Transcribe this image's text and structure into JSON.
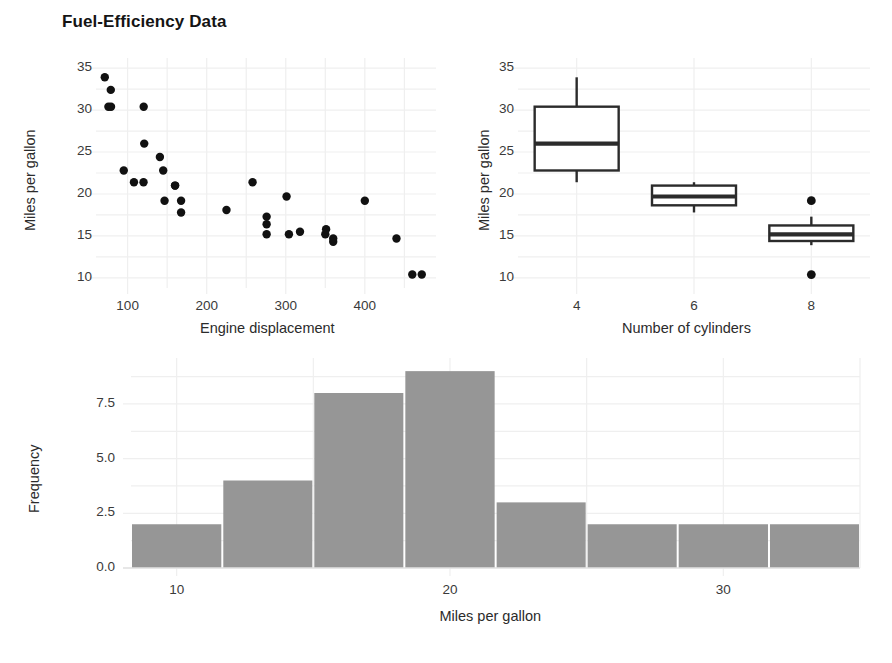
{
  "figure": {
    "title": "Fuel-Efficiency Data",
    "background_color": "#ffffff",
    "grid_color": "#efefef",
    "point_color": "#111111",
    "bar_color": "#969696",
    "box_line_color": "#2b2b2b"
  },
  "chart_data": [
    {
      "type": "scatter",
      "id": "mpg-vs-displacement",
      "title": "",
      "xlabel": "Engine displacement",
      "ylabel": "Miles per gallon",
      "xlim": [
        60,
        490
      ],
      "ylim": [
        8.8,
        36.2
      ],
      "xticks": [
        100,
        200,
        300,
        400
      ],
      "yticks": [
        10,
        15,
        20,
        25,
        30,
        35
      ],
      "grid": true,
      "legend": "none",
      "x": [
        71.1,
        75.7,
        78.7,
        79.0,
        95.1,
        108.0,
        120.1,
        120.3,
        121.0,
        140.8,
        145.0,
        146.7,
        160.0,
        160.0,
        167.6,
        167.6,
        225.0,
        258.0,
        275.8,
        275.8,
        275.8,
        301.0,
        304.0,
        318.0,
        350.0,
        351.0,
        360.0,
        360.0,
        400.0,
        440.0,
        460.0,
        472.0
      ],
      "y": [
        33.9,
        30.4,
        32.4,
        30.4,
        22.8,
        21.4,
        21.4,
        30.4,
        26.0,
        24.4,
        22.8,
        19.2,
        21.0,
        21.0,
        17.8,
        19.2,
        18.1,
        21.4,
        16.4,
        17.3,
        15.2,
        19.7,
        15.2,
        15.5,
        15.2,
        15.8,
        14.3,
        14.7,
        19.2,
        14.7,
        10.4,
        10.4
      ]
    },
    {
      "type": "boxplot",
      "id": "mpg-by-cylinders",
      "title": "",
      "xlabel": "Number of cylinders",
      "ylabel": "Miles per gallon",
      "ylim": [
        8.8,
        36.2
      ],
      "yticks": [
        10,
        15,
        20,
        25,
        30,
        35
      ],
      "xticks": [
        "4",
        "6",
        "8"
      ],
      "grid": true,
      "legend": "none",
      "boxes": [
        {
          "category": "4",
          "min": 21.4,
          "q1": 22.8,
          "median": 26.0,
          "q3": 30.4,
          "max": 33.9,
          "outliers": []
        },
        {
          "category": "6",
          "min": 17.8,
          "q1": 18.65,
          "median": 19.7,
          "q3": 21.0,
          "max": 21.4,
          "outliers": []
        },
        {
          "category": "8",
          "min": 13.9,
          "q1": 14.4,
          "median": 15.2,
          "q3": 16.25,
          "max": 17.3,
          "outliers": [
            19.2,
            10.4
          ]
        }
      ]
    },
    {
      "type": "bar",
      "id": "mpg-histogram",
      "title": "",
      "xlabel": "Miles per gallon",
      "ylabel": "Frequency",
      "xlim": [
        8.33,
        35.0
      ],
      "ylim": [
        0,
        9.6
      ],
      "xticks": [
        10,
        20,
        30
      ],
      "yticks": [
        0.0,
        2.5,
        5.0,
        7.5
      ],
      "ytick_labels": [
        "0.0",
        "2.5",
        "5.0",
        "7.5"
      ],
      "grid": true,
      "legend": "none",
      "bin_edges": [
        8.33,
        11.67,
        15.0,
        18.33,
        21.67,
        25.0,
        28.33,
        31.67,
        35.0
      ],
      "bin_centers": [
        10.0,
        13.33,
        16.67,
        20.0,
        23.33,
        26.67,
        30.0,
        33.33
      ],
      "categories": [
        "8.3-11.7",
        "11.7-15.0",
        "15.0-18.3",
        "18.3-21.7",
        "21.7-25.0",
        "25.0-28.3",
        "28.3-31.7",
        "31.7-35.0"
      ],
      "values": [
        2,
        4,
        8,
        9,
        3,
        2,
        2,
        2
      ]
    }
  ]
}
